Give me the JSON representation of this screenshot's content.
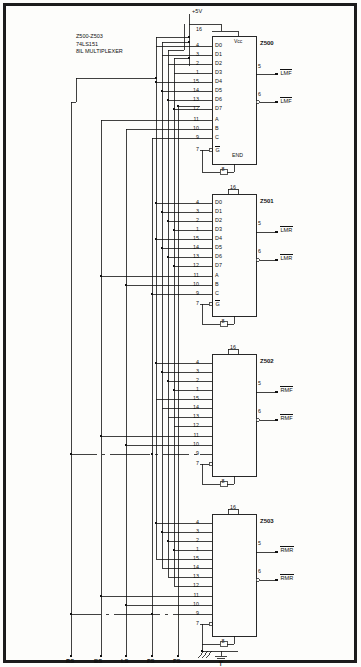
{
  "meta": {
    "line_color": "#111111",
    "background": "#fdfdfb"
  },
  "header_note": {
    "line1": "Z500-Z503",
    "line2": "74LS151",
    "line3": "8IL MULTIPLEXER"
  },
  "power": {
    "supply_label": "+5V",
    "vcc_pin_label": "16",
    "vcc_name": "Vcc",
    "gnd_pin_label": "8",
    "gnd_symbol_label": "T"
  },
  "enable_note": "END",
  "data_pin_numbers": [
    "4",
    "3",
    "2",
    "1",
    "15",
    "14",
    "13",
    "12"
  ],
  "data_pin_names": [
    "D0",
    "D1",
    "D2",
    "D3",
    "D4",
    "D5",
    "D6",
    "D7"
  ],
  "select_pin_numbers": [
    "11",
    "10",
    "9"
  ],
  "select_pin_names": [
    "A",
    "B",
    "C"
  ],
  "enable_pin_number": "7",
  "enable_pin_name": "G",
  "output_pin_numbers": [
    "5",
    "6"
  ],
  "ics": [
    {
      "ref": "Z500",
      "show_internal_labels": true,
      "show_end_label": true,
      "outputs": [
        {
          "pin": "5",
          "label": "LMF",
          "overline": true,
          "bubble": false
        },
        {
          "pin": "6",
          "label": "LMF",
          "overline": true,
          "bubble": true
        }
      ]
    },
    {
      "ref": "Z501",
      "show_internal_labels": true,
      "show_end_label": false,
      "outputs": [
        {
          "pin": "5",
          "label": "LMR",
          "overline": true,
          "bubble": false
        },
        {
          "pin": "6",
          "label": "LMR",
          "overline": true,
          "bubble": true
        }
      ]
    },
    {
      "ref": "Z502",
      "show_internal_labels": false,
      "show_end_label": false,
      "outputs": [
        {
          "pin": "5",
          "label": "RMF",
          "overline": true,
          "bubble": false
        },
        {
          "pin": "6",
          "label": "RMF",
          "overline": true,
          "bubble": true
        }
      ]
    },
    {
      "ref": "Z503",
      "show_internal_labels": false,
      "show_end_label": false,
      "outputs": [
        {
          "pin": "5",
          "label": "RMR",
          "overline": true,
          "bubble": false
        },
        {
          "pin": "6",
          "label": "RMR",
          "overline": true,
          "bubble": true
        }
      ]
    }
  ],
  "bus_inputs": [
    {
      "label": "RS",
      "x": 65
    },
    {
      "label": "BS",
      "x": 93
    },
    {
      "label": "LS",
      "x": 120
    },
    {
      "label": "FS",
      "x": 146
    },
    {
      "label": "FS",
      "x": 172
    }
  ]
}
